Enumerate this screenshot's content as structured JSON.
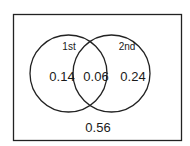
{
  "diagram": {
    "type": "venn",
    "sets": [
      {
        "label": "1st"
      },
      {
        "label": "2nd"
      }
    ],
    "regions": {
      "only_first": "0.14",
      "intersection": "0.06",
      "only_second": "0.24",
      "outside": "0.56"
    },
    "colors": {
      "stroke": "#222222",
      "text": "#1a1a1a",
      "background": "#ffffff"
    }
  }
}
